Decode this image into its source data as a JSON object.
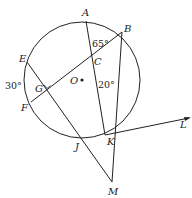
{
  "diagram": {
    "type": "geometry-circle",
    "stroke_color": "#222222",
    "circle": {
      "center_label": "O",
      "cx": 82,
      "cy": 80,
      "r": 58
    },
    "points": {
      "A": {
        "label": "A",
        "x": 86,
        "y": 21
      },
      "B": {
        "label": "B",
        "x": 122,
        "y": 32
      },
      "C": {
        "label": "C",
        "x": 92,
        "y": 61
      },
      "E": {
        "label": "E",
        "x": 27,
        "y": 62
      },
      "F": {
        "label": "F",
        "x": 31,
        "y": 102
      },
      "G": {
        "label": "G",
        "x": 47,
        "y": 87
      },
      "J": {
        "label": "J",
        "x": 79,
        "y": 138
      },
      "K": {
        "label": "K",
        "x": 105,
        "y": 134
      },
      "L": {
        "label": "L",
        "x": 190,
        "y": 117
      },
      "M": {
        "label": "M",
        "x": 112,
        "y": 182
      },
      "O": {
        "label": "O",
        "x": 82,
        "y": 80
      }
    },
    "angles": {
      "angle_ACB": "65°",
      "angle_BKA": "20°",
      "arc_EF": "30°"
    },
    "segments": [
      "A-K",
      "B-F",
      "E-M",
      "B-M",
      "K-L"
    ],
    "right_angle_at": "G"
  }
}
